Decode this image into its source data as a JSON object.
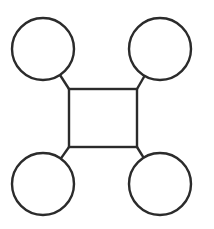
{
  "diagram": {
    "title": "",
    "canvas": {
      "width": 214,
      "height": 229,
      "background": "#ffffff"
    },
    "stroke_color": "#2b2b2b",
    "center_node": {
      "shape": "square",
      "label": "",
      "x": 69,
      "y": 89,
      "width": 68,
      "height": 58
    },
    "satellite_nodes": [
      {
        "id": "top-left",
        "shape": "circle",
        "label": "",
        "cx": 43,
        "cy": 49,
        "r": 31
      },
      {
        "id": "top-right",
        "shape": "circle",
        "label": "",
        "cx": 160,
        "cy": 49,
        "r": 31
      },
      {
        "id": "bottom-left",
        "shape": "circle",
        "label": "",
        "cx": 43,
        "cy": 184,
        "r": 31
      },
      {
        "id": "bottom-right",
        "shape": "circle",
        "label": "",
        "cx": 160,
        "cy": 184,
        "r": 31
      }
    ],
    "edges": [
      {
        "from": "center-top-left-corner",
        "to": "top-left",
        "x1": 69,
        "y1": 89,
        "x2": 60,
        "y2": 75
      },
      {
        "from": "center-top-right-corner",
        "to": "top-right",
        "x1": 137,
        "y1": 89,
        "x2": 144.5,
        "y2": 76
      },
      {
        "from": "center-bottom-left-corner",
        "to": "bottom-left",
        "x1": 69,
        "y1": 147,
        "x2": 60.8,
        "y2": 158.6
      },
      {
        "from": "center-bottom-right-corner",
        "to": "bottom-right",
        "x1": 137,
        "y1": 147,
        "x2": 143.6,
        "y2": 157.7
      }
    ]
  }
}
